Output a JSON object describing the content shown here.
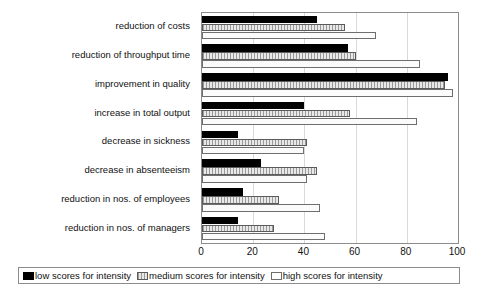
{
  "chart_data": {
    "type": "bar",
    "orientation": "horizontal",
    "title": "",
    "xlabel": "",
    "ylabel": "",
    "xlim": [
      0,
      100
    ],
    "xticks": [
      0,
      20,
      40,
      60,
      80,
      100
    ],
    "grid": true,
    "legend_position": "bottom",
    "categories": [
      "reduction of costs",
      "reduction of throughput time",
      "improvement in quality",
      "increase in total output",
      "decrease in sickness",
      "decrease in absenteeism",
      "reduction in nos. of employees",
      "reduction in nos. of managers"
    ],
    "series": [
      {
        "name": "low scores for intensity",
        "color": "#000000",
        "values": [
          45,
          57,
          96,
          40,
          14,
          23,
          16,
          14
        ]
      },
      {
        "name": "medium scores for intensity",
        "color": "#cfcfcf",
        "values": [
          56,
          60,
          95,
          58,
          41,
          45,
          30,
          28
        ]
      },
      {
        "name": "high scores for intensity",
        "color": "#ffffff",
        "values": [
          68,
          85,
          98,
          84,
          40,
          41,
          46,
          48
        ]
      }
    ]
  }
}
